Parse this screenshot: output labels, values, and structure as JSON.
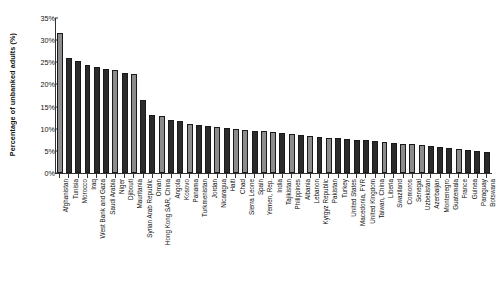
{
  "chart_data": {
    "type": "bar",
    "title": "",
    "xlabel": "",
    "ylabel": "Percentage of unbanked adults (%)",
    "ylim": [
      0,
      35
    ],
    "ytick_labels": [
      "35%",
      "30%",
      "25%",
      "20%",
      "15%",
      "10%",
      "5%",
      "0%"
    ],
    "ytick_values": [
      35,
      30,
      25,
      20,
      15,
      10,
      5,
      0
    ],
    "grid": false,
    "legend": "none",
    "categories": [
      "Afghanistan",
      "Tunisia",
      "Morocco",
      "Iraq",
      "West Bank and Gaza",
      "Saudi Arabia",
      "Niger",
      "Djibouti",
      "Mauritania",
      "Syrian Arab Republic",
      "Oman",
      "Hong Kong SAR, China",
      "Angola",
      "Kosovo",
      "Panama",
      "Turkmenistan",
      "Jordan",
      "Nicaragua",
      "Haiti",
      "Chad",
      "Sierra Leone",
      "Spain",
      "Yemen, Rep.",
      "India",
      "Tajikistan",
      "Philippines",
      "Albania",
      "Lebanon",
      "Kyrgyz Republic",
      "Pakistan",
      "Turkey",
      "United States",
      "Macedonia, FYR",
      "United Kingdom",
      "Taiwan, China",
      "Liberia",
      "Swaziland",
      "Comoros",
      "Senegal",
      "Uzbekistan",
      "Azerbaijan",
      "Montenegro",
      "Guatemala",
      "France",
      "Guinea",
      "Paraguay",
      "Botswana"
    ],
    "values": [
      31.7,
      26.0,
      25.3,
      24.3,
      24.0,
      23.5,
      23.3,
      22.5,
      22.3,
      16.5,
      13.0,
      12.8,
      12.0,
      11.8,
      11.0,
      10.8,
      10.6,
      10.4,
      10.2,
      10.0,
      9.8,
      9.6,
      9.4,
      9.2,
      9.0,
      8.8,
      8.6,
      8.4,
      8.2,
      8.0,
      7.8,
      7.6,
      7.5,
      7.4,
      7.2,
      7.0,
      6.8,
      6.6,
      6.5,
      6.3,
      6.0,
      5.8,
      5.6,
      5.4,
      5.2,
      5.0,
      4.8
    ],
    "bar_shades": [
      "light",
      "dark",
      "dark",
      "dark",
      "dark",
      "dark",
      "light",
      "dark",
      "light",
      "dark",
      "dark",
      "light",
      "dark",
      "dark",
      "light",
      "dark",
      "dark",
      "light",
      "dark",
      "light",
      "light",
      "dark",
      "light",
      "light",
      "dark",
      "light",
      "dark",
      "light",
      "dark",
      "light",
      "dark",
      "dark",
      "dark",
      "dark",
      "dark",
      "light",
      "dark",
      "light",
      "light",
      "light",
      "dark",
      "dark",
      "dark",
      "light",
      "dark",
      "dark",
      "dark"
    ],
    "colors": {
      "bar_light": "#8c8c8c",
      "bar_dark": "#2b2b2b",
      "axis": "#333333",
      "background": "#ffffff",
      "text": "#111111"
    }
  }
}
